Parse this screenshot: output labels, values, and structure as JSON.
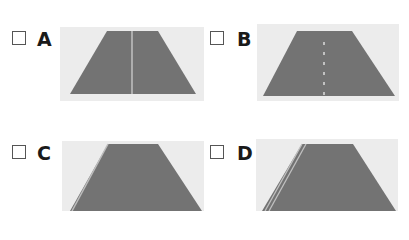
{
  "options": [
    {
      "letter": "A",
      "image": "road with solid center line",
      "checked": false
    },
    {
      "letter": "B",
      "image": "road with dashed center line",
      "checked": false
    },
    {
      "letter": "C",
      "image": "road with single solid edge line on left",
      "checked": false
    },
    {
      "letter": "D",
      "image": "road with double solid edge lines on left",
      "checked": false
    }
  ],
  "colors": {
    "road": "#707070",
    "panel_bg": "#ececec",
    "line": "#d8d8d8"
  }
}
